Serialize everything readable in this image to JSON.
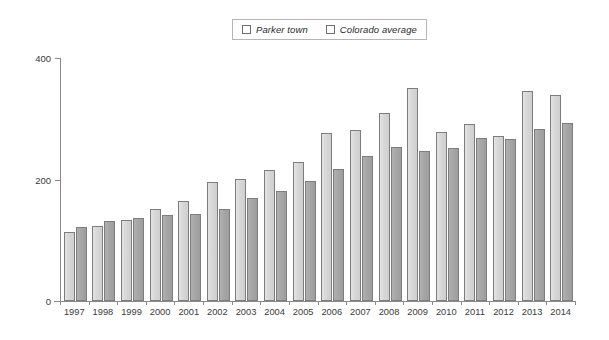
{
  "chart_data": {
    "type": "bar",
    "title": "",
    "subtitle": "",
    "xlabel": "",
    "ylabel": "",
    "categories": [
      "1997",
      "1998",
      "1999",
      "2000",
      "2001",
      "2002",
      "2003",
      "2004",
      "2005",
      "2006",
      "2007",
      "2008",
      "2009",
      "2010",
      "2011",
      "2012",
      "2013",
      "2014"
    ],
    "series": [
      {
        "name": "Parker town",
        "color": "#d7d7d7",
        "values": [
          113,
          124,
          134,
          152,
          165,
          196,
          201,
          216,
          229,
          277,
          281,
          310,
          351,
          278,
          291,
          272,
          345,
          339
        ]
      },
      {
        "name": "Colorado average",
        "color": "#a6a6a6",
        "values": [
          122,
          131,
          136,
          141,
          143,
          152,
          169,
          181,
          197,
          218,
          238,
          253,
          247,
          252,
          268,
          266,
          283,
          293
        ]
      }
    ],
    "ylim": [
      0,
      400
    ],
    "yticks": [
      0,
      200,
      400
    ],
    "ytick_labels": [
      "0",
      "200",
      "400"
    ],
    "grid": false,
    "legend_position": "top-center",
    "axis_color": "#8a8a8a"
  },
  "legend": {
    "entries": [
      {
        "label": "Parker town",
        "swatch_color": "#d7d7d7"
      },
      {
        "label": "Colorado average",
        "swatch_color": "#a6a6a6"
      }
    ]
  },
  "axes": {
    "y_tick_labels": [
      "400",
      "200",
      "0"
    ],
    "x_tick_labels": [
      "1997",
      "1998",
      "1999",
      "2000",
      "2001",
      "2002",
      "2003",
      "2004",
      "2005",
      "2006",
      "2007",
      "2008",
      "2009",
      "2010",
      "2011",
      "2012",
      "2013",
      "2014"
    ]
  }
}
